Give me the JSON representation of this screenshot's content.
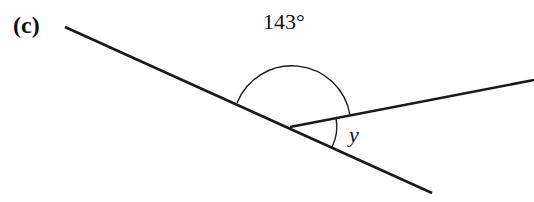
{
  "part_label": "(c)",
  "angle_label": "143°",
  "unknown_label": "y",
  "stroke_color": "#1a1a1a",
  "geometry": {
    "vertex": [
      290,
      127
    ],
    "line_start": [
      65,
      27
    ],
    "line_end": [
      432,
      193
    ],
    "ray_end": [
      534,
      80
    ],
    "obtuse_angle_deg": 143,
    "unknown_angle": "y"
  }
}
